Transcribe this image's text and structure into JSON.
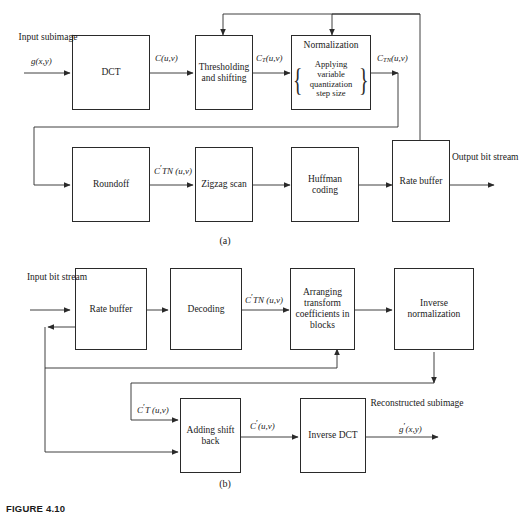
{
  "figure": {
    "caption": "FIGURE 4.10"
  },
  "subcaptions": {
    "a": "(a)",
    "b": "(b)"
  },
  "diagram_a": {
    "boxes": [
      {
        "name": "dct",
        "label": "DCT"
      },
      {
        "name": "thresholding",
        "label": "Thresholding and shifting"
      },
      {
        "name": "normalization",
        "title": "Normalization",
        "inner": "Applying variable quantization step size",
        "brace_left": "{",
        "brace_right": "}"
      },
      {
        "name": "roundoff",
        "label": "Roundoff"
      },
      {
        "name": "zigzag",
        "label": "Zigzag scan"
      },
      {
        "name": "huffman",
        "label": "Huffman coding"
      },
      {
        "name": "rate-buffer",
        "label": "Rate buffer"
      }
    ],
    "labels": {
      "input": "Input subimage",
      "input_math": "g(x,y)",
      "c_uv": "C(u,v)",
      "ct_uv": "CT(u,v)",
      "ctn_uv": "CTN(u,v)",
      "ctn_prime_uv": "C'TN (u,v)",
      "output": "Output bit stream"
    }
  },
  "diagram_b": {
    "boxes": [
      {
        "name": "rate-buffer",
        "label": "Rate buffer"
      },
      {
        "name": "decoding",
        "label": "Decoding"
      },
      {
        "name": "arranging",
        "label": "Arranging transform coefficients in blocks"
      },
      {
        "name": "inverse-normalization",
        "label": "Inverse normalization"
      },
      {
        "name": "adding-shift-back",
        "label": "Adding shift back"
      },
      {
        "name": "inverse-dct",
        "label": "Inverse DCT"
      }
    ],
    "labels": {
      "input": "Input bit stream",
      "ctn_prime_uv": "C'TN (u,v)",
      "ct_prime_uv": "C'T (u,v)",
      "c_prime_uv": "C'(u,v)",
      "output": "Reconstructed subimage",
      "output_math": "g'(x,y)"
    }
  },
  "colors": {
    "ink": "#1a1a1a",
    "line": "#2a2a2a",
    "background": "#ffffff"
  }
}
